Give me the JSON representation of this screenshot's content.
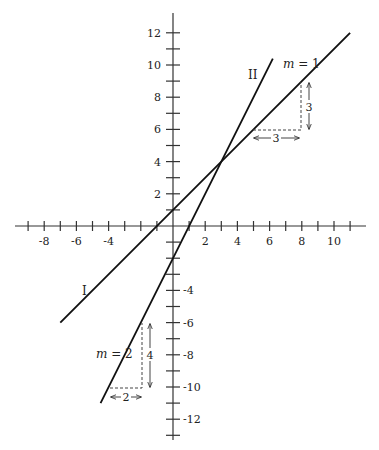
{
  "chart_data": {
    "type": "line",
    "title": "",
    "xlabel": "",
    "ylabel": "",
    "xlim": [
      -9.5,
      12
    ],
    "ylim": [
      -13,
      12.5
    ],
    "grid": false,
    "x_tick_labels": [
      "-8",
      "-6",
      "-4",
      "2",
      "4",
      "6",
      "8",
      "10"
    ],
    "y_tick_labels": [
      "12",
      "10",
      "8",
      "6",
      "4",
      "2",
      "-4",
      "-6",
      "-8",
      "-10",
      "-12"
    ],
    "series": [
      {
        "name": "I",
        "equation": "y = x + 1",
        "slope": 1,
        "intercept": 1,
        "x": [
          -7,
          11
        ],
        "y": [
          -6,
          12
        ],
        "label": "I",
        "slope_label": "m = 1"
      },
      {
        "name": "II",
        "equation": "y = 2x - 2",
        "slope": 2,
        "intercept": -2,
        "x": [
          -4.5,
          6.2
        ],
        "y": [
          -11,
          10.4
        ],
        "label": "II",
        "slope_label": "m = 2"
      }
    ],
    "intersection": {
      "x": 3,
      "y": 4
    },
    "annotations": [
      {
        "type": "slope-triangle",
        "line": "I",
        "run": 3,
        "rise": 3,
        "run_label": "3",
        "rise_label": "3",
        "from": [
          5,
          6
        ],
        "to": [
          8,
          9
        ]
      },
      {
        "type": "slope-triangle",
        "line": "II",
        "run": 2,
        "rise": 4,
        "run_label": "2",
        "rise_label": "4",
        "from": [
          -4,
          -10
        ],
        "to": [
          -2,
          -6
        ]
      }
    ]
  },
  "labels": {
    "line1": "I",
    "line2": "II",
    "m1_var": "m",
    "m1_rest": " = 1",
    "m2_var": "m",
    "m2_rest": " = 2",
    "run1": "3",
    "rise1": "3",
    "run2": "2",
    "rise2": "4"
  }
}
